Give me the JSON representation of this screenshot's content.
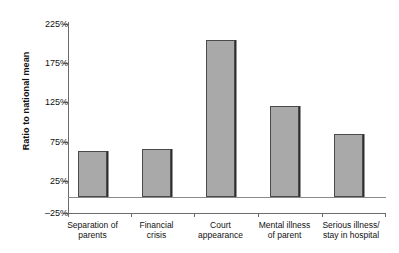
{
  "chart_data": {
    "type": "bar",
    "title": "",
    "xlabel": "",
    "ylabel": "Ratio to national mean",
    "categories": [
      "Separation of\nparents",
      "Financial\ncrisis",
      "Court\nappearance",
      "Mental illness\nof parent",
      "Serious illness/\nstay in hospital"
    ],
    "values": [
      60,
      63,
      204,
      119,
      82
    ],
    "ylim": [
      -25,
      225
    ],
    "ytick_values": [
      225,
      175,
      125,
      75,
      25,
      -25
    ],
    "ytick_labels": [
      "225%",
      "175%",
      "125%",
      "75%",
      "25%",
      "–25%"
    ],
    "grid": false,
    "legend": false,
    "bar_fill_color": "#a9a9a9",
    "bar_edge_color": "#4a4a4a",
    "axis_color": "#6b6b6b",
    "background_color": "#ffffff"
  },
  "axis": {
    "ylabel": "Ratio to national mean"
  },
  "ticks": [
    {
      "label": "225%"
    },
    {
      "label": "175%"
    },
    {
      "label": "125%"
    },
    {
      "label": "75%"
    },
    {
      "label": "25%"
    },
    {
      "label": "–25%"
    }
  ],
  "categories": [
    {
      "line1": "Separation of",
      "line2": "parents"
    },
    {
      "line1": "Financial",
      "line2": "crisis"
    },
    {
      "line1": "Court",
      "line2": "appearance"
    },
    {
      "line1": "Mental illness",
      "line2": "of parent"
    },
    {
      "line1": "Serious illness/",
      "line2": "stay in hospital"
    }
  ]
}
